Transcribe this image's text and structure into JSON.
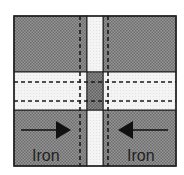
{
  "diagram": {
    "type": "cross-section schematic",
    "colors": {
      "iron_fill": "#8a8a8a",
      "iron_pattern_dot": "#6a6a6a",
      "gap_fill": "#f2f2f2",
      "center_fill": "#7d7d7d",
      "line": "#222222"
    },
    "blocks": [
      {
        "id": "top-left",
        "label": ""
      },
      {
        "id": "top-right",
        "label": ""
      },
      {
        "id": "bottom-left",
        "label": "Iron",
        "arrow": "right"
      },
      {
        "id": "bottom-right",
        "label": "Iron",
        "arrow": "left"
      }
    ],
    "labels": {
      "bottom_left": "Iron",
      "bottom_right": "Iron"
    }
  }
}
